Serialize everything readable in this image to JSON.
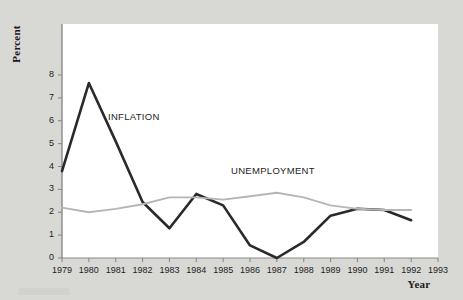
{
  "figure": {
    "background_color": "#d8d8d5",
    "panel_color": "#ffffff"
  },
  "axes": {
    "ylabel": "Percent",
    "xlabel": "Year"
  },
  "chart_data": {
    "type": "line",
    "title": "",
    "xlabel": "Year",
    "ylabel": "Percent",
    "xlim": [
      1979,
      1993
    ],
    "ylim": [
      0,
      8
    ],
    "grid": false,
    "legend_position": "inline-annotation",
    "x": [
      1979,
      1980,
      1981,
      1982,
      1983,
      1984,
      1985,
      1986,
      1987,
      1988,
      1989,
      1990,
      1991,
      1992
    ],
    "xticks": [
      "1979",
      "1980",
      "1981",
      "1982",
      "1983",
      "1984",
      "1985",
      "1986",
      "1987",
      "1988",
      "1989",
      "1990",
      "1991",
      "1992",
      "1993"
    ],
    "yticks": [
      "0",
      "1",
      "2",
      "3",
      "4",
      "5",
      "6",
      "7",
      "8"
    ],
    "series": [
      {
        "name": "INFLATION",
        "color": "#2a2a2a",
        "width": 2.6,
        "values": [
          3.8,
          7.65,
          5.1,
          2.45,
          1.3,
          2.8,
          2.3,
          0.55,
          0.0,
          0.7,
          1.85,
          2.15,
          2.1,
          1.65
        ]
      },
      {
        "name": "UNEMPLOYMENT",
        "color": "#b5b5b5",
        "width": 1.9,
        "values": [
          2.2,
          2.0,
          2.15,
          2.35,
          2.65,
          2.65,
          2.55,
          2.7,
          2.85,
          2.65,
          2.3,
          2.15,
          2.1,
          2.1
        ]
      }
    ]
  }
}
